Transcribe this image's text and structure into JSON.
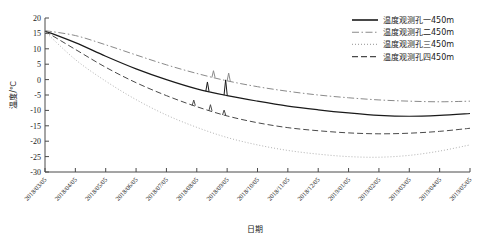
{
  "chart_data": {
    "type": "line",
    "title": "",
    "xlabel": "日期",
    "ylabel": "温度/℃",
    "ylim": [
      -30,
      20
    ],
    "yticks": [
      20,
      15,
      10,
      5,
      0,
      -5,
      -10,
      -15,
      -20,
      -25,
      -30
    ],
    "grid": false,
    "legend_position": "top-right",
    "categories": [
      "2018/03/05",
      "2018/04/05",
      "2018/05/05",
      "2018/06/05",
      "2018/07/05",
      "2018/08/05",
      "2018/09/05",
      "2018/10/05",
      "2018/11/05",
      "2018/12/05",
      "2019/01/05",
      "2019/02/05",
      "2019/03/05",
      "2019/04/05",
      "2019/05/05"
    ],
    "series": [
      {
        "name": "温度观测孔一450m",
        "style": "solid",
        "color": "#1a1a1a",
        "values": [
          15.8,
          12.0,
          7.6,
          3.5,
          0.0,
          -3.0,
          -5.2,
          -7.0,
          -8.6,
          -9.8,
          -10.8,
          -11.6,
          -11.9,
          -11.6,
          -11.0
        ]
      },
      {
        "name": "温度观测孔二450m",
        "style": "dash-dot",
        "color": "#8a8a8a",
        "values": [
          15.9,
          14.3,
          11.3,
          8.0,
          4.8,
          2.0,
          -0.4,
          -2.3,
          -3.8,
          -5.0,
          -5.9,
          -6.6,
          -7.0,
          -7.2,
          -7.0
        ]
      },
      {
        "name": "温度观测孔三450m",
        "style": "dotted",
        "color": "#a8a8a8",
        "values": [
          15.6,
          6.5,
          -0.5,
          -6.5,
          -11.5,
          -15.5,
          -18.8,
          -21.2,
          -23.0,
          -24.2,
          -25.0,
          -25.2,
          -24.6,
          -23.2,
          -21.2
        ]
      },
      {
        "name": "温度观测孔四450m",
        "style": "dashed",
        "color": "#4a4a4a",
        "values": [
          15.7,
          9.8,
          4.0,
          -1.0,
          -5.2,
          -8.8,
          -11.8,
          -14.0,
          -15.6,
          -16.6,
          -17.3,
          -17.6,
          -17.4,
          -16.8,
          -15.8
        ]
      }
    ]
  }
}
